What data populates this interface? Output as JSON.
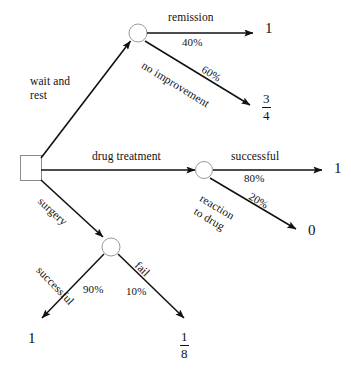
{
  "diagram": {
    "type": "decision-tree",
    "title": "",
    "root": {
      "shape": "square",
      "name": "decision-node"
    },
    "branches": [
      {
        "id": "wait-and-rest",
        "label": "wait and\nrest",
        "label_line1": "wait and",
        "label_line2": "rest",
        "from": "root",
        "to": "chance-node-wait",
        "probability": null
      },
      {
        "id": "remission",
        "label": "remission",
        "probability": "40%",
        "from": "chance-node-wait",
        "payoff": "1"
      },
      {
        "id": "no-improvement",
        "label": "no improvement",
        "probability": "60%",
        "from": "chance-node-wait",
        "payoff_numerator": "3",
        "payoff_denominator": "4"
      },
      {
        "id": "drug-treatment",
        "label": "drug treatment",
        "from": "root",
        "to": "chance-node-drug",
        "probability": null
      },
      {
        "id": "successful-drug",
        "label": "successful",
        "probability": "80%",
        "from": "chance-node-drug",
        "payoff": "1"
      },
      {
        "id": "reaction-to-drug",
        "label": "reaction\nto drug",
        "label_line1": "reaction",
        "label_line2": "to drug",
        "probability": "20%",
        "from": "chance-node-drug",
        "payoff": "0"
      },
      {
        "id": "surgery",
        "label": "surgery",
        "from": "root",
        "to": "chance-node-surgery",
        "probability": null
      },
      {
        "id": "successful-surgery",
        "label": "successful",
        "probability": "90%",
        "from": "chance-node-surgery",
        "payoff": "1"
      },
      {
        "id": "fail-surgery",
        "label": "fail",
        "probability": "10%",
        "from": "chance-node-surgery",
        "payoff_numerator": "1",
        "payoff_denominator": "8"
      }
    ],
    "labels": {
      "wait_and_rest_line1": "wait and",
      "wait_and_rest_line2": "rest",
      "remission": "remission",
      "remission_pct": "40%",
      "no_improvement": "no improvement",
      "no_improvement_pct": "60%",
      "drug_treatment": "drug treatment",
      "successful_drug": "successful",
      "successful_drug_pct": "80%",
      "reaction_line1": "reaction",
      "reaction_line2": "to drug",
      "reaction_pct": "20%",
      "surgery": "surgery",
      "successful_surgery": "successful",
      "successful_surgery_pct": "90%",
      "fail": "fail",
      "fail_pct": "10%"
    },
    "payoffs": {
      "remission": "1",
      "no_improvement_num": "3",
      "no_improvement_den": "4",
      "successful_drug": "1",
      "reaction_to_drug": "0",
      "successful_surgery": "1",
      "fail_num": "1",
      "fail_den": "8"
    },
    "colors": {
      "stroke": "#111111",
      "background": "#ffffff",
      "node_fill": "#ffffff"
    }
  }
}
